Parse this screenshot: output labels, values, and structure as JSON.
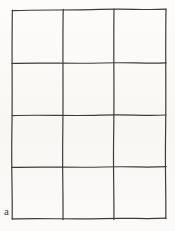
{
  "figure": {
    "kind": "hand-drawn-grid-diagram",
    "panel_label": "a",
    "background_color": "#fbfaf7",
    "line_color": "#3c3c3a",
    "label_color": "#3a3a38",
    "grid": {
      "columns": 3,
      "rows": 4,
      "cells_total": 12,
      "outer_rect": {
        "x": 12,
        "y": 10,
        "width": 154,
        "height": 209
      },
      "vertical_line_x": [
        12,
        63,
        114,
        166
      ],
      "horizontal_line_y": [
        10,
        63,
        115,
        167,
        219
      ],
      "column_widths": [
        51,
        51,
        52
      ],
      "row_heights": [
        53,
        52,
        52,
        52
      ],
      "stroke_width": 1.2,
      "style": "hand-drawn"
    }
  }
}
